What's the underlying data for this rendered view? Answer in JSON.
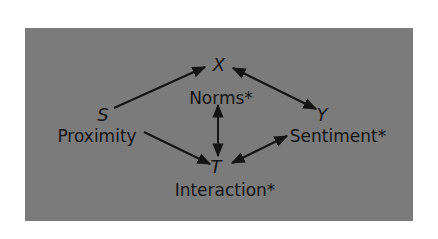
{
  "diagram": {
    "colors": {
      "panel": "#7b7b7b",
      "ink": "#141414",
      "background": "#ffffff"
    },
    "nodes": [
      {
        "id": "X",
        "variable": "X",
        "label": "Norms*"
      },
      {
        "id": "S",
        "variable": "S",
        "label": "Proximity"
      },
      {
        "id": "Y",
        "variable": "Y",
        "label": "Sentiment*"
      },
      {
        "id": "T",
        "variable": "T",
        "label": "Interaction*"
      }
    ],
    "edges": [
      {
        "from": "S",
        "to": "X",
        "type": "directed"
      },
      {
        "from": "S",
        "to": "T",
        "type": "directed"
      },
      {
        "from": "X",
        "to": "Y",
        "type": "bidirectional"
      },
      {
        "from": "X",
        "to": "T",
        "type": "bidirectional"
      },
      {
        "from": "T",
        "to": "Y",
        "type": "bidirectional"
      }
    ]
  }
}
